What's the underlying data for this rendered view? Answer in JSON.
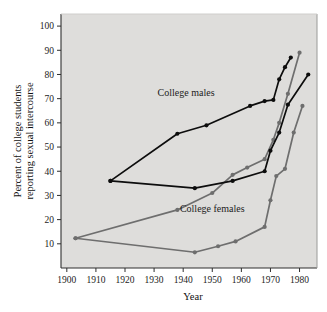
{
  "chart_data": {
    "type": "line",
    "title": "",
    "xlabel": "Year",
    "ylabel": "Percent of college students reporting sexual intercourse",
    "ylabel_line1": "Percent of college students",
    "ylabel_line2": "reporting sexual intercourse",
    "xlim": [
      1898,
      1986
    ],
    "ylim": [
      0,
      105
    ],
    "xticks": [
      1900,
      1910,
      1920,
      1930,
      1940,
      1950,
      1960,
      1970,
      1980
    ],
    "xtick_labels": [
      "1900",
      "1910",
      "1920",
      "1930",
      "1940",
      "1950",
      "1960",
      "1970",
      "1980"
    ],
    "yticks": [
      10,
      20,
      30,
      40,
      50,
      60,
      70,
      80,
      90,
      100
    ],
    "ytick_labels": [
      "10",
      "20",
      "30",
      "40",
      "50",
      "60",
      "70",
      "80",
      "90",
      "100"
    ],
    "grid": false,
    "legend_position": "inline-annotation",
    "annotations": [
      {
        "text": "College males",
        "x": 1941,
        "y": 71
      },
      {
        "text": "College females",
        "x": 1950,
        "y": 23
      }
    ],
    "colors": {
      "males": "#0d0d0d",
      "females": "#6e6e6e",
      "plot_background": "#dedddb",
      "page_background": "#ffffff",
      "axis": "#2e2e2e"
    },
    "series": [
      {
        "name": "College males (upper)",
        "group": "males",
        "color": "#0d0d0d",
        "x": [
          1915,
          1938,
          1948,
          1963,
          1968,
          1971,
          1973,
          1975,
          1977
        ],
        "values": [
          36,
          55.5,
          59,
          67,
          69,
          69.5,
          78,
          83,
          87
        ]
      },
      {
        "name": "College males (lower)",
        "group": "males",
        "color": "#0d0d0d",
        "x": [
          1915,
          1944,
          1957,
          1968,
          1970,
          1973,
          1976,
          1983
        ],
        "values": [
          36,
          33,
          36,
          40,
          48.5,
          56,
          67.5,
          80
        ]
      },
      {
        "name": "College females (upper)",
        "group": "females",
        "color": "#6e6e6e",
        "x": [
          1903,
          1938,
          1950,
          1957,
          1962,
          1968,
          1971,
          1973,
          1976,
          1980
        ],
        "values": [
          12.3,
          24,
          31,
          38.5,
          41.5,
          45,
          53,
          60,
          72,
          89
        ]
      },
      {
        "name": "College females (lower)",
        "group": "females",
        "color": "#6e6e6e",
        "x": [
          1903,
          1944,
          1952,
          1958,
          1968,
          1970,
          1972,
          1975,
          1978,
          1981
        ],
        "values": [
          12.3,
          6.5,
          9,
          11,
          17,
          28,
          38,
          41,
          56,
          67
        ]
      }
    ]
  }
}
